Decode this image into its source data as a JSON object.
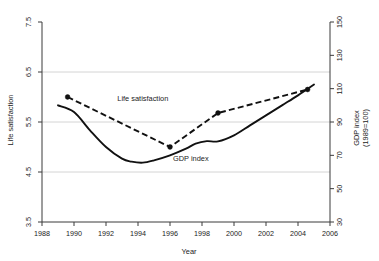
{
  "chart_data": {
    "type": "line",
    "title": "",
    "xlabel": "Year",
    "ylabel": "Life satisfaction",
    "y2label_line1": "GDP index",
    "y2label_line2": "(1989=100)",
    "xlim": [
      1988,
      2006
    ],
    "ylim": [
      3.5,
      7.5
    ],
    "y2lim": [
      30,
      150
    ],
    "grid": "horizontal gridlines at left-axis values 6.5, 5.5, 4.5",
    "gridlines_left": [
      6.5,
      5.5,
      4.5
    ],
    "legend_position": "inline annotations on plot",
    "xticks": [
      1988,
      1990,
      1992,
      1994,
      1996,
      1998,
      2000,
      2002,
      2004,
      2006
    ],
    "xtick_labels": [
      "1988",
      "1990",
      "1992",
      "1994",
      "1996",
      "1998",
      "2000",
      "2002",
      "2004",
      "2006"
    ],
    "yticks": [
      3.5,
      4.5,
      5.5,
      6.5,
      7.5
    ],
    "ytick_labels": [
      "3.5",
      "4.5",
      "5.5",
      "6.5",
      "7.5"
    ],
    "y2ticks": [
      30,
      50,
      70,
      90,
      110,
      130,
      150
    ],
    "y2tick_labels": [
      "30",
      "50",
      "70",
      "90",
      "110",
      "130",
      "150"
    ],
    "annotations": [
      {
        "text": "Life satisfaction",
        "x": 1994.3,
        "y_axis": "left",
        "y": 5.92
      },
      {
        "text": "GDP index",
        "x": 1997.3,
        "y_axis": "right",
        "y": 66.5
      }
    ],
    "series": [
      {
        "name": "Life satisfaction",
        "axis": "left",
        "style": "dashed",
        "markers": true,
        "x": [
          1989.6,
          1996.0,
          1999.0,
          2004.6
        ],
        "values": [
          6.0,
          5.0,
          5.68,
          6.15
        ]
      },
      {
        "name": "GDP index",
        "axis": "right",
        "style": "solid",
        "markers": false,
        "x": [
          1989.0,
          1990.0,
          1991.0,
          1992.0,
          1993.0,
          1993.6,
          1994.3,
          1995.0,
          1996.0,
          1997.0,
          1997.6,
          1998.3,
          1999.0,
          2000.0,
          2001.0,
          2002.0,
          2003.0,
          2004.0,
          2005.0
        ],
        "values": [
          100.0,
          96.0,
          85.0,
          75.0,
          68.0,
          66.2,
          65.6,
          67.0,
          70.0,
          74.0,
          77.0,
          78.5,
          78.4,
          82.0,
          88.0,
          94.0,
          100.0,
          106.0,
          112.5
        ]
      }
    ]
  }
}
